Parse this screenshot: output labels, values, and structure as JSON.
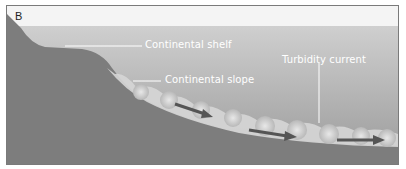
{
  "figure": {
    "panel_label": "B",
    "labels": {
      "continental_shelf": "Continental shelf",
      "continental_slope": "Continental slope",
      "turbidity_current": "Turbidity current"
    },
    "colors": {
      "sky_band": "#f4f4f4",
      "water_top": "#c9c9c9",
      "water_bottom": "#9e9e9e",
      "land": "#7d7d7d",
      "sediment": "#dcdcdc",
      "arrow": "#5a5a5a",
      "leader": "#ffffff",
      "border": "#7a7a7a"
    }
  }
}
